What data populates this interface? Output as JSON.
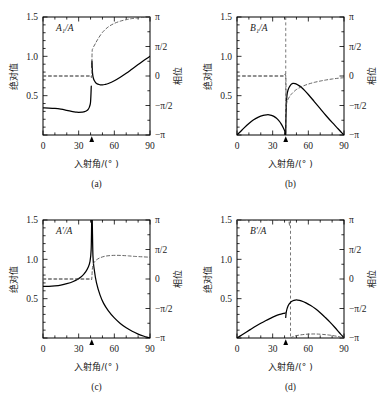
{
  "figure": {
    "background": "#ffffff",
    "line_color": "#000000",
    "dashed_color": "#555555"
  },
  "panels": [
    {
      "id": "a",
      "caption": "(a)",
      "curve_label": "A₁/A",
      "xlabel": "入射角/(° )",
      "ylabel_left": "绝对值",
      "ylabel_right": "相位",
      "xticks": [
        "0",
        "30",
        "60",
        "90"
      ],
      "yticks_left": [
        "0.5",
        "1.0",
        "1.5"
      ],
      "yticks_right": [
        "−π",
        "−π/2",
        "0",
        "π/2",
        "π"
      ],
      "critical_angle_marker": 41
    },
    {
      "id": "b",
      "caption": "(b)",
      "curve_label": "B₁/A",
      "xlabel": "入射角/(° )",
      "ylabel_left": "绝对值",
      "ylabel_right": "相位",
      "xticks": [
        "0",
        "30",
        "60",
        "90"
      ],
      "yticks_left": [
        "0.5",
        "1.0",
        "1.5"
      ],
      "yticks_right": [
        "−π",
        "−π/2",
        "0",
        "π/2",
        "π"
      ],
      "critical_angle_marker": 41
    },
    {
      "id": "c",
      "caption": "(c)",
      "curve_label": "A′/A",
      "xlabel": "入射角/(° )",
      "ylabel_left": "绝对值",
      "ylabel_right": "相位",
      "xticks": [
        "0",
        "30",
        "60",
        "90"
      ],
      "yticks_left": [
        "0.5",
        "1.0",
        "1.5"
      ],
      "yticks_right": [
        "−π",
        "−π/2",
        "0",
        "π/2",
        "π"
      ],
      "critical_angle_marker": 41
    },
    {
      "id": "d",
      "caption": "(d)",
      "curve_label": "B′/A",
      "xlabel": "入射角/(° )",
      "ylabel_left": "绝对值",
      "ylabel_right": "相位",
      "xticks": [
        "0",
        "30",
        "60",
        "90"
      ],
      "yticks_left": [
        "0.5",
        "1.0",
        "1.5"
      ],
      "yticks_right": [
        "−π",
        "−π/2",
        "0",
        "π/2",
        "π"
      ],
      "critical_angle_marker": 41
    }
  ],
  "chart_data": [
    {
      "type": "line",
      "title": "A₁/A",
      "panel": "a",
      "xlabel": "入射角/(° )",
      "ylabel": "绝对值",
      "ylabel_secondary": "相位",
      "xlim": [
        0,
        90
      ],
      "ylim": [
        0,
        1.5
      ],
      "ylim_secondary": [
        -3.14159,
        3.14159
      ],
      "xticks": [
        0,
        30,
        60,
        90
      ],
      "yticks": [
        0.5,
        1.0,
        1.5
      ],
      "yticks_secondary_labels": [
        "−π",
        "−π/2",
        "0",
        "π/2",
        "π"
      ],
      "yticks_secondary": [
        -3.14159,
        -1.5708,
        0,
        1.5708,
        3.14159
      ],
      "grid": false,
      "legend": "none",
      "annotation_arrow_x": 41,
      "series": [
        {
          "name": "magnitude",
          "style": "solid",
          "x": [
            0,
            5,
            10,
            15,
            20,
            25,
            28,
            30,
            33,
            35,
            37,
            38,
            39,
            40,
            40.6,
            41,
            41.2,
            41.6,
            42,
            43,
            45,
            48,
            50,
            52,
            55,
            60,
            65,
            70,
            75,
            80,
            85,
            90
          ],
          "y": [
            0.345,
            0.343,
            0.338,
            0.328,
            0.313,
            0.297,
            0.291,
            0.289,
            0.291,
            0.296,
            0.312,
            0.327,
            0.355,
            0.42,
            0.62,
            0.86,
            0.94,
            0.8,
            0.745,
            0.695,
            0.655,
            0.638,
            0.637,
            0.642,
            0.655,
            0.69,
            0.735,
            0.785,
            0.84,
            0.895,
            0.95,
            1.0
          ]
        },
        {
          "name": "phase",
          "style": "dashed",
          "axis": "secondary",
          "x": [
            0,
            10,
            20,
            30,
            35,
            38,
            40,
            41,
            41.3,
            42,
            44,
            46,
            50,
            55,
            60,
            65,
            70,
            75,
            80,
            85,
            90
          ],
          "y": [
            0,
            0,
            0,
            0,
            0,
            0,
            0,
            0,
            1.25,
            1.48,
            1.72,
            1.95,
            2.32,
            2.62,
            2.8,
            2.92,
            3.0,
            3.06,
            3.1,
            3.12,
            3.14
          ]
        }
      ]
    },
    {
      "type": "line",
      "title": "B₁/A",
      "panel": "b",
      "xlabel": "入射角/(° )",
      "ylabel": "绝对值",
      "ylabel_secondary": "相位",
      "xlim": [
        0,
        90
      ],
      "ylim": [
        0,
        1.5
      ],
      "ylim_secondary": [
        -3.14159,
        3.14159
      ],
      "xticks": [
        0,
        30,
        60,
        90
      ],
      "yticks": [
        0.5,
        1.0,
        1.5
      ],
      "yticks_secondary_labels": [
        "−π",
        "−π/2",
        "0",
        "π/2",
        "π"
      ],
      "yticks_secondary": [
        -3.14159,
        -1.5708,
        0,
        1.5708,
        3.14159
      ],
      "grid": false,
      "legend": "none",
      "annotation_arrow_x": 41,
      "vertical_dashed_x": 41,
      "series": [
        {
          "name": "magnitude",
          "style": "solid",
          "x": [
            0,
            3,
            6,
            10,
            14,
            18,
            22,
            25,
            27,
            29,
            31,
            33,
            35,
            37,
            39,
            40,
            40.7,
            41,
            41.3,
            42,
            43,
            45,
            47,
            49,
            51,
            55,
            60,
            65,
            70,
            75,
            80,
            85,
            88,
            90
          ],
          "y": [
            0.0,
            0.045,
            0.09,
            0.145,
            0.193,
            0.228,
            0.25,
            0.257,
            0.257,
            0.25,
            0.237,
            0.215,
            0.185,
            0.145,
            0.09,
            0.055,
            0.01,
            0.0,
            0.3,
            0.5,
            0.575,
            0.635,
            0.655,
            0.652,
            0.638,
            0.595,
            0.515,
            0.425,
            0.335,
            0.245,
            0.16,
            0.08,
            0.03,
            0.0
          ]
        },
        {
          "name": "phase",
          "style": "dashed",
          "axis": "secondary",
          "x": [
            0,
            10,
            20,
            30,
            35,
            39,
            41,
            41.3,
            42,
            44,
            46,
            50,
            55,
            60,
            65,
            70,
            75,
            80,
            85,
            90
          ],
          "y": [
            0,
            0,
            0,
            0,
            0,
            0,
            0,
            -1.62,
            -1.38,
            -1.12,
            -0.95,
            -0.72,
            -0.55,
            -0.43,
            -0.34,
            -0.27,
            -0.21,
            -0.16,
            -0.12,
            -0.09
          ]
        }
      ]
    },
    {
      "type": "line",
      "title": "A′/A",
      "panel": "c",
      "xlabel": "入射角/(° )",
      "ylabel": "绝对值",
      "ylabel_secondary": "相位",
      "xlim": [
        0,
        90
      ],
      "ylim": [
        0,
        1.5
      ],
      "ylim_secondary": [
        -3.14159,
        3.14159
      ],
      "xticks": [
        0,
        30,
        60,
        90
      ],
      "yticks": [
        0.5,
        1.0,
        1.5
      ],
      "yticks_secondary_labels": [
        "−π",
        "−π/2",
        "0",
        "π/2",
        "π"
      ],
      "yticks_secondary": [
        -3.14159,
        -1.5708,
        0,
        1.5708,
        3.14159
      ],
      "grid": false,
      "legend": "none",
      "annotation_arrow_x": 41,
      "series": [
        {
          "name": "magnitude",
          "style": "solid",
          "x": [
            0,
            5,
            10,
            15,
            20,
            25,
            30,
            33,
            36,
            38,
            39.5,
            40.5,
            41,
            41.4,
            42,
            43,
            45,
            48,
            51,
            55,
            60,
            65,
            70,
            75,
            80,
            85,
            88,
            90
          ],
          "y": [
            0.655,
            0.657,
            0.663,
            0.673,
            0.69,
            0.715,
            0.755,
            0.79,
            0.845,
            0.9,
            0.97,
            1.12,
            1.5,
            1.5,
            1.05,
            0.88,
            0.7,
            0.545,
            0.44,
            0.345,
            0.255,
            0.185,
            0.13,
            0.085,
            0.05,
            0.022,
            0.008,
            0.0
          ]
        },
        {
          "name": "phase",
          "style": "dashed",
          "axis": "secondary",
          "x": [
            0,
            10,
            20,
            30,
            36,
            39,
            40.5,
            41,
            41.5,
            42,
            43,
            45,
            48,
            52,
            57,
            62,
            67,
            72,
            78,
            84,
            90
          ],
          "y": [
            0,
            0,
            0,
            0,
            0,
            0,
            0,
            0,
            0.52,
            0.72,
            0.88,
            1.02,
            1.13,
            1.21,
            1.25,
            1.26,
            1.25,
            1.23,
            1.2,
            1.18,
            1.16
          ]
        }
      ]
    },
    {
      "type": "line",
      "title": "B′/A",
      "panel": "d",
      "xlabel": "入射角/(° )",
      "ylabel": "绝对值",
      "ylabel_secondary": "相位",
      "xlim": [
        0,
        90
      ],
      "ylim": [
        0,
        1.5
      ],
      "ylim_secondary": [
        -3.14159,
        3.14159
      ],
      "xticks": [
        0,
        30,
        60,
        90
      ],
      "yticks": [
        0.5,
        1.0,
        1.5
      ],
      "yticks_secondary_labels": [
        "−π",
        "−π/2",
        "0",
        "π/2",
        "π"
      ],
      "yticks_secondary": [
        -3.14159,
        -1.5708,
        0,
        1.5708,
        3.14159
      ],
      "grid": false,
      "legend": "none",
      "annotation_arrow_x": 41,
      "vertical_dashed_x": 45,
      "series": [
        {
          "name": "magnitude",
          "style": "solid",
          "x": [
            0,
            4,
            8,
            12,
            16,
            20,
            24,
            28,
            32,
            36,
            39,
            40.6,
            41,
            41.5,
            43,
            45,
            47,
            49,
            51,
            54,
            58,
            62,
            66,
            70,
            74,
            78,
            82,
            86,
            88,
            90
          ],
          "y": [
            0.0,
            0.038,
            0.077,
            0.115,
            0.152,
            0.187,
            0.22,
            0.25,
            0.278,
            0.3,
            0.312,
            0.318,
            0.262,
            0.335,
            0.41,
            0.452,
            0.473,
            0.482,
            0.482,
            0.472,
            0.447,
            0.413,
            0.372,
            0.322,
            0.265,
            0.205,
            0.14,
            0.07,
            0.036,
            0.0
          ]
        },
        {
          "name": "phase",
          "style": "dashed",
          "axis": "secondary",
          "x": [
            0,
            10,
            20,
            30,
            36,
            40,
            42,
            43.5,
            44.2,
            44.8,
            45,
            45.2,
            46,
            48,
            52,
            57,
            62,
            67,
            72,
            78,
            84,
            90
          ],
          "y": [
            3.14,
            3.14,
            3.14,
            3.14,
            3.14,
            3.14,
            3.14,
            3.14,
            2.86,
            3.05,
            3.14,
            -3.14,
            -3.1,
            -3.05,
            -2.99,
            -2.95,
            -2.93,
            -2.93,
            -2.95,
            -2.99,
            -3.05,
            -3.14
          ]
        }
      ]
    }
  ]
}
